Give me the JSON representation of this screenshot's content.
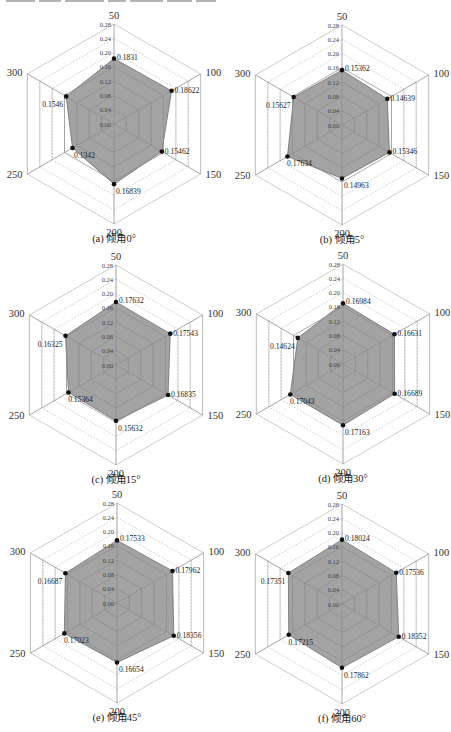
{
  "figure": {
    "top_text_fragment": "(cut-off line of text, illegible)",
    "fill_color": "#9b9b9b",
    "fill_stroke": "#6e6e6e",
    "grid_color": "#b8b8b8",
    "axis_color": "#aaaaaa",
    "marker_color": "#111111"
  },
  "chart_data": [
    {
      "type": "radar",
      "caption": "(a) 倾角0°",
      "axes": [
        "50",
        "100",
        "150",
        "200",
        "250",
        "300"
      ],
      "radial_ticks": [
        "0.00",
        "0.04",
        "0.08",
        "0.12",
        "0.16",
        "0.20",
        "0.24",
        "0.28"
      ],
      "rlim": [
        0,
        0.28
      ],
      "values": [
        0.1831,
        0.18622,
        0.15462,
        0.16839,
        0.1342,
        0.1546
      ],
      "value_labels": [
        "0.1831",
        "0.18622",
        "0.15462",
        "0.16839",
        "0.1342",
        "0.1546"
      ],
      "center": [
        114,
        124
      ]
    },
    {
      "type": "radar",
      "caption": "(b) 倾角5°",
      "axes": [
        "50",
        "100",
        "150",
        "200",
        "250",
        "300"
      ],
      "radial_ticks": [
        "0.00",
        "0.04",
        "0.08",
        "0.12",
        "0.16",
        "0.20",
        "0.24",
        "0.28"
      ],
      "rlim": [
        0,
        0.28
      ],
      "values": [
        0.15362,
        0.14639,
        0.15346,
        0.14963,
        0.17634,
        0.15627
      ],
      "value_labels": [
        "0.15362",
        "0.14639",
        "0.15346",
        "0.14963",
        "0.17634",
        "0.15627"
      ],
      "center": [
        342,
        125
      ]
    },
    {
      "type": "radar",
      "caption": "(c) 倾角15°",
      "axes": [
        "50",
        "100",
        "150",
        "200",
        "250",
        "300"
      ],
      "radial_ticks": [
        "0.00",
        "0.04",
        "0.08",
        "0.12",
        "0.16",
        "0.20",
        "0.24",
        "0.28"
      ],
      "rlim": [
        0,
        0.28
      ],
      "values": [
        0.17632,
        0.17543,
        0.16835,
        0.15632,
        0.15364,
        0.16325
      ],
      "value_labels": [
        "0.17632",
        "0.17543",
        "0.16835",
        "0.15632",
        "0.15364",
        "0.16325"
      ],
      "center": [
        116,
        365
      ]
    },
    {
      "type": "radar",
      "caption": "(d) 倾角30°",
      "axes": [
        "50",
        "100",
        "150",
        "200",
        "250",
        "300"
      ],
      "radial_ticks": [
        "0.00",
        "0.04",
        "0.08",
        "0.12",
        "0.16",
        "0.20",
        "0.24",
        "0.28"
      ],
      "rlim": [
        0,
        0.28
      ],
      "values": [
        0.16984,
        0.16631,
        0.16689,
        0.17163,
        0.17043,
        0.14624
      ],
      "value_labels": [
        "0.16984",
        "0.16631",
        "0.16689",
        "0.17163",
        "0.17043",
        "0.14624"
      ],
      "center": [
        343,
        364
      ]
    },
    {
      "type": "radar",
      "caption": "(e) 倾角45°",
      "axes": [
        "50",
        "100",
        "150",
        "200",
        "250",
        "300"
      ],
      "radial_ticks": [
        "0.00",
        "0.04",
        "0.08",
        "0.12",
        "0.16",
        "0.20",
        "0.24",
        "0.28"
      ],
      "rlim": [
        0,
        0.28
      ],
      "values": [
        0.17533,
        0.17962,
        0.18356,
        0.16654,
        0.17023,
        0.16687
      ],
      "value_labels": [
        "0.17533",
        "0.17962",
        "0.18356",
        "0.16654",
        "0.17023",
        "0.16687"
      ],
      "center": [
        117,
        603
      ]
    },
    {
      "type": "radar",
      "caption": "(f) 倾角60°",
      "axes": [
        "50",
        "100",
        "150",
        "200",
        "250",
        "300"
      ],
      "radial_ticks": [
        "0.00",
        "0.04",
        "0.08",
        "0.12",
        "0.16",
        "0.20",
        "0.24",
        "0.28"
      ],
      "rlim": [
        0,
        0.28
      ],
      "values": [
        0.18024,
        0.17536,
        0.18352,
        0.17862,
        0.17215,
        0.17351
      ],
      "value_labels": [
        "0.18024",
        "0.17536",
        "0.18352",
        "0.17862",
        "0.17215",
        "0.17351"
      ],
      "center": [
        342,
        604
      ]
    }
  ]
}
